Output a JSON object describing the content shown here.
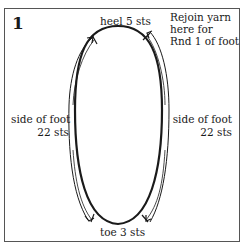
{
  "figure": {
    "number": "1",
    "labels": {
      "heel": "heel 5 sts",
      "rejoin_line1": "Rejoin yarn",
      "rejoin_line2": "here for",
      "rejoin_line3": "Rnd 1 of foot",
      "left_side_line1": "side of foot",
      "left_side_line2": "22 sts",
      "right_side_line1": "side of foot",
      "right_side_line2": "22 sts",
      "toe": "toe 3 sts"
    },
    "colors": {
      "ink": "#1a1a1a",
      "border": "#555555",
      "background": "#ffffff"
    }
  }
}
